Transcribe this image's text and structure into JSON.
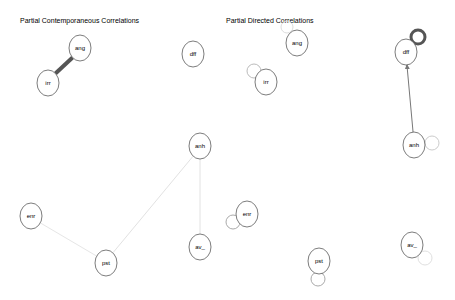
{
  "panels": [
    {
      "title": "Partial Contemporaneous Correlations",
      "title_pos": [
        20,
        23
      ],
      "nodes": [
        {
          "id": "ang",
          "label": "ang",
          "x": 80,
          "y": 48
        },
        {
          "id": "irr",
          "label": "irr",
          "x": 48,
          "y": 83
        },
        {
          "id": "dff",
          "label": "dff",
          "x": 193,
          "y": 54
        },
        {
          "id": "anh",
          "label": "anh",
          "x": 200,
          "y": 146
        },
        {
          "id": "av_",
          "label": "av_",
          "x": 200,
          "y": 247
        },
        {
          "id": "enr",
          "label": "enr",
          "x": 31,
          "y": 216
        },
        {
          "id": "pst",
          "label": "pst",
          "x": 106,
          "y": 263
        }
      ],
      "edges": [
        {
          "from": "ang",
          "to": "irr",
          "color": "#555555",
          "width": 4
        },
        {
          "from": "anh",
          "to": "pst",
          "color": "#e2e2e2",
          "width": 1
        },
        {
          "from": "anh",
          "to": "av_",
          "color": "#e2e2e2",
          "width": 1
        },
        {
          "from": "enr",
          "to": "pst",
          "color": "#e6e6e6",
          "width": 1
        }
      ]
    },
    {
      "title": "Partial Directed Correlations",
      "title_pos": [
        226,
        23
      ],
      "nodes": [
        {
          "id": "ang",
          "label": "ang",
          "x": 297,
          "y": 43
        },
        {
          "id": "irr",
          "label": "irr",
          "x": 266,
          "y": 82
        },
        {
          "id": "dff",
          "label": "dff",
          "x": 406,
          "y": 52
        },
        {
          "id": "anh",
          "label": "anh",
          "x": 414,
          "y": 145
        },
        {
          "id": "av_",
          "label": "av_",
          "x": 412,
          "y": 245
        },
        {
          "id": "enr",
          "label": "enr",
          "x": 247,
          "y": 214
        },
        {
          "id": "pst",
          "label": "pst",
          "x": 319,
          "y": 261
        }
      ],
      "edges": [
        {
          "from": "anh",
          "to": "dff",
          "color": "#777777",
          "width": 1,
          "directed": true
        }
      ],
      "loops": [
        {
          "node": "ang",
          "cx": 287,
          "cy": 27,
          "r": 6,
          "color": "#dddddd",
          "width": 1
        },
        {
          "node": "irr",
          "cx": 254,
          "cy": 71,
          "r": 7,
          "color": "#bbbbbb",
          "width": 1
        },
        {
          "node": "dff",
          "cx": 418,
          "cy": 37,
          "r": 7,
          "color": "#555555",
          "width": 3
        },
        {
          "node": "anh",
          "cx": 432,
          "cy": 143,
          "r": 7,
          "color": "#cccccc",
          "width": 1
        },
        {
          "node": "enr",
          "cx": 233,
          "cy": 222,
          "r": 7,
          "color": "#aaaaaa",
          "width": 1
        },
        {
          "node": "pst",
          "cx": 318,
          "cy": 279,
          "r": 7,
          "color": "#aaaaaa",
          "width": 1
        },
        {
          "node": "av_",
          "cx": 425,
          "cy": 258,
          "r": 7,
          "color": "#e0e0e0",
          "width": 1
        }
      ]
    }
  ]
}
